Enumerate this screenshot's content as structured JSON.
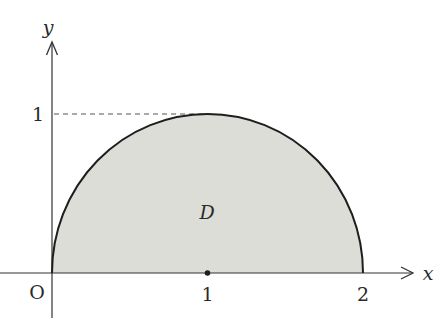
{
  "diagram": {
    "type": "region-plot",
    "region_label": "D",
    "axes": {
      "x_label": "x",
      "y_label": "y",
      "origin_label": "O"
    },
    "ticks": {
      "x": [
        {
          "value": 1,
          "label": "1",
          "marked_point": true
        },
        {
          "value": 2,
          "label": "2",
          "marked_point": false
        }
      ],
      "y": [
        {
          "value": 1,
          "label": "1",
          "dashed_guide": true
        }
      ]
    },
    "curve": {
      "shape": "semicircle",
      "center": [
        1,
        0
      ],
      "radius": 1,
      "half": "upper"
    },
    "colors": {
      "fill": "#dcddd6",
      "stroke": "#1e1e1e",
      "axis": "#333333",
      "dashed": "#555555"
    }
  }
}
